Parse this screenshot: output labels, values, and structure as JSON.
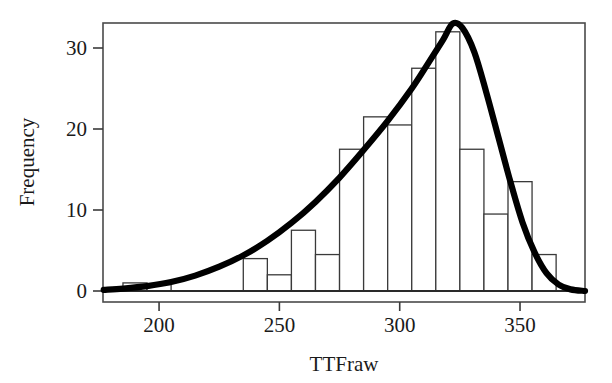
{
  "chart_data": {
    "type": "bar",
    "title": "",
    "subtitle": "",
    "xlabel": "TTFraw",
    "ylabel": "Frequency",
    "xlim": [
      176.7,
      377.0
    ],
    "ylim": [
      0,
      33.5
    ],
    "xticks": [
      200,
      250,
      300,
      350
    ],
    "xtick_labels": [
      "200",
      "250",
      "300",
      "350"
    ],
    "yticks": [
      0,
      10,
      20,
      30
    ],
    "ytick_labels": [
      "0",
      "10",
      "20",
      "30"
    ],
    "grid": false,
    "legend": null,
    "bin_width": 10,
    "bins": [
      {
        "x0": 185,
        "x1": 195,
        "center": 190,
        "value": 1.0
      },
      {
        "x0": 195,
        "x1": 205,
        "center": 200,
        "value": 0.8
      },
      {
        "x0": 205,
        "x1": 215,
        "center": 210,
        "value": 0
      },
      {
        "x0": 215,
        "x1": 225,
        "center": 220,
        "value": 0
      },
      {
        "x0": 225,
        "x1": 235,
        "center": 230,
        "value": 0
      },
      {
        "x0": 235,
        "x1": 245,
        "center": 240,
        "value": 4.0
      },
      {
        "x0": 245,
        "x1": 255,
        "center": 250,
        "value": 2.0
      },
      {
        "x0": 255,
        "x1": 265,
        "center": 260,
        "value": 7.5
      },
      {
        "x0": 265,
        "x1": 275,
        "center": 270,
        "value": 4.5
      },
      {
        "x0": 275,
        "x1": 285,
        "center": 280,
        "value": 17.5
      },
      {
        "x0": 285,
        "x1": 295,
        "center": 290,
        "value": 21.5
      },
      {
        "x0": 295,
        "x1": 305,
        "center": 300,
        "value": 20.5
      },
      {
        "x0": 305,
        "x1": 315,
        "center": 310,
        "value": 27.5
      },
      {
        "x0": 315,
        "x1": 325,
        "center": 320,
        "value": 32.0
      },
      {
        "x0": 325,
        "x1": 335,
        "center": 330,
        "value": 17.5
      },
      {
        "x0": 335,
        "x1": 345,
        "center": 340,
        "value": 9.5
      },
      {
        "x0": 345,
        "x1": 355,
        "center": 350,
        "value": 13.5
      },
      {
        "x0": 355,
        "x1": 365,
        "center": 360,
        "value": 4.5
      }
    ],
    "overlay_curve": {
      "name": "normal-density-fit",
      "type": "line",
      "mean": 322,
      "stdev": 33,
      "peak_value": 33.0,
      "points": [
        {
          "x": 177,
          "y": 0.15
        },
        {
          "x": 185,
          "y": 0.3
        },
        {
          "x": 195,
          "y": 0.6
        },
        {
          "x": 205,
          "y": 1.1
        },
        {
          "x": 215,
          "y": 1.9
        },
        {
          "x": 225,
          "y": 3.0
        },
        {
          "x": 235,
          "y": 4.4
        },
        {
          "x": 245,
          "y": 6.2
        },
        {
          "x": 255,
          "y": 8.4
        },
        {
          "x": 265,
          "y": 11.0
        },
        {
          "x": 275,
          "y": 14.0
        },
        {
          "x": 285,
          "y": 17.4
        },
        {
          "x": 295,
          "y": 21.0
        },
        {
          "x": 305,
          "y": 25.0
        },
        {
          "x": 312,
          "y": 28.2
        },
        {
          "x": 318,
          "y": 31.0
        },
        {
          "x": 322,
          "y": 33.0
        },
        {
          "x": 326,
          "y": 32.5
        },
        {
          "x": 331,
          "y": 29.5
        },
        {
          "x": 336,
          "y": 24.5
        },
        {
          "x": 341,
          "y": 19.0
        },
        {
          "x": 346,
          "y": 13.5
        },
        {
          "x": 351,
          "y": 8.5
        },
        {
          "x": 356,
          "y": 4.8
        },
        {
          "x": 361,
          "y": 2.2
        },
        {
          "x": 366,
          "y": 0.8
        },
        {
          "x": 371,
          "y": 0.2
        },
        {
          "x": 377,
          "y": 0.0
        }
      ]
    },
    "colors": {
      "bar_fill": "#ffffff",
      "bar_stroke": "#3a3a3a",
      "curve": "#000000",
      "axis": "#4a4a4a",
      "text": "#1a1a1a",
      "background": "#ffffff"
    }
  }
}
